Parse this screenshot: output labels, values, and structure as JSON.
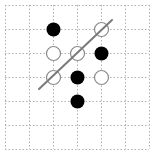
{
  "diagram": {
    "type": "grid-scatter-classification",
    "grid": {
      "cols": 6,
      "rows": 6,
      "origin_x": 5,
      "origin_y": 5,
      "cell": 24,
      "line_color": "#b0b0b0",
      "line_style": "dotted"
    },
    "points": [
      {
        "col": 2,
        "row": 1,
        "filled": true
      },
      {
        "col": 4,
        "row": 1,
        "filled": false
      },
      {
        "col": 2,
        "row": 2,
        "filled": false
      },
      {
        "col": 3,
        "row": 2,
        "filled": false
      },
      {
        "col": 4,
        "row": 2,
        "filled": true
      },
      {
        "col": 2,
        "row": 3,
        "filled": false
      },
      {
        "col": 3,
        "row": 3,
        "filled": true
      },
      {
        "col": 4,
        "row": 3,
        "filled": false
      },
      {
        "col": 3,
        "row": 4,
        "filled": true
      }
    ],
    "point_radius": 7,
    "filled_color": "#000000",
    "open_stroke_color": "#8a8a8a",
    "separator_line": {
      "x1": 39,
      "y1": 89,
      "x2": 112,
      "y2": 20,
      "color": "#7a7a7a",
      "width": 2
    }
  }
}
